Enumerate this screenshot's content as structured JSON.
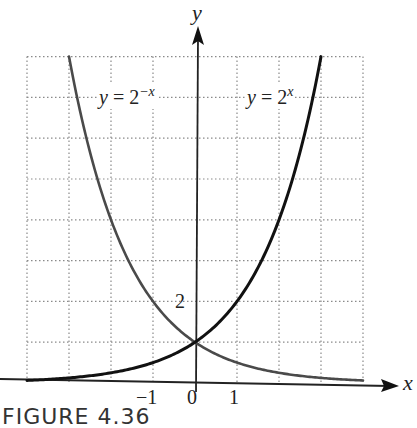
{
  "chart_data": {
    "type": "line",
    "title": "",
    "xlabel": "x",
    "ylabel": "y",
    "xlim": [
      -4,
      4
    ],
    "ylim": [
      0,
      8
    ],
    "grid": true,
    "grid_style": "dotted",
    "x_tick_labels": [
      {
        "value": -1,
        "label": "−1"
      },
      {
        "value": 0,
        "label": "0"
      },
      {
        "value": 1,
        "label": "1"
      }
    ],
    "y_tick_labels": [
      {
        "value": 2,
        "label": "2"
      }
    ],
    "series": [
      {
        "name": "y = 2^(-x)",
        "label_main": "y = 2",
        "label_sup": "−x",
        "color": "#4a4a4a",
        "x": [
          -3,
          -2,
          -1,
          0,
          1,
          2,
          3,
          4
        ],
        "values": [
          8,
          4,
          2,
          1,
          0.5,
          0.25,
          0.125,
          0.0625
        ]
      },
      {
        "name": "y = 2^x",
        "label_main": "y = 2",
        "label_sup": "x",
        "color": "#111111",
        "x": [
          -4,
          -3,
          -2,
          -1,
          0,
          1,
          2,
          3
        ],
        "values": [
          0.0625,
          0.125,
          0.25,
          0.5,
          1,
          2,
          4,
          8
        ]
      }
    ],
    "intersection": {
      "x": 0,
      "y": 1
    }
  },
  "axis_labels": {
    "x": "x",
    "y": "y"
  },
  "caption": "FIGURE 4.36"
}
